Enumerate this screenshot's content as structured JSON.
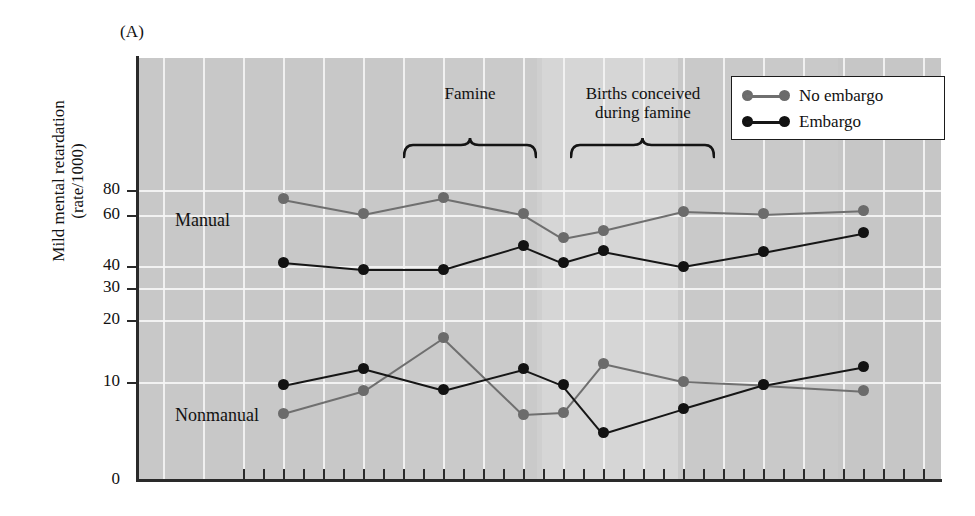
{
  "figure": {
    "panel_letter": "(A)",
    "y_axis_title_line1": "Mild mental retardation",
    "y_axis_title_line2": "(rate/1000)"
  },
  "legend": {
    "position": "top-right-inside",
    "items": [
      {
        "label": "No embargo",
        "color": "#6b6b6b"
      },
      {
        "label": "Embargo",
        "color": "#121212"
      }
    ]
  },
  "annotations": [
    {
      "name": "famine",
      "text": "Famine",
      "text2": ""
    },
    {
      "name": "births-conceived-during-famine",
      "text": "Births conceived",
      "text2": "during famine"
    }
  ],
  "group_labels": [
    {
      "name": "manual",
      "text": "Manual"
    },
    {
      "name": "nonmanual",
      "text": "Nonmanual"
    }
  ],
  "chart_data": {
    "type": "line",
    "title": "(A)",
    "xlabel": "",
    "ylabel": "Mild mental retardation (rate/1000)",
    "ylim": [
      0,
      90
    ],
    "y_ticks": [
      0,
      10,
      20,
      30,
      40,
      60,
      80
    ],
    "y_tick_labels": [
      "0",
      "10",
      "20",
      "30",
      "40",
      "60",
      "80"
    ],
    "y_axis_note": "broken / non-linear scale: spacing between 40-60 and 60-80 is compressed",
    "grid": true,
    "legend_entries": [
      "No embargo",
      "Embargo"
    ],
    "x_tick_count": 37,
    "x_tick_labels": [],
    "annotation_spans": [
      {
        "label": "Famine",
        "x_start_px": 403,
        "x_end_px": 537
      },
      {
        "label": "Births conceived during famine",
        "x_start_px": 570,
        "x_end_px": 715
      }
    ],
    "panels": [
      {
        "name": "Manual",
        "series": [
          {
            "name": "No embargo",
            "color": "#6b6b6b",
            "points": [
              {
                "x": 283,
                "y": 73
              },
              {
                "x": 363,
                "y": 61
              },
              {
                "x": 443,
                "y": 74
              },
              {
                "x": 523,
                "y": 61
              },
              {
                "x": 563,
                "y": 51
              },
              {
                "x": 603,
                "y": 54
              },
              {
                "x": 683,
                "y": 63
              },
              {
                "x": 763,
                "y": 61
              },
              {
                "x": 863,
                "y": 64
              }
            ]
          },
          {
            "name": "Embargo",
            "color": "#121212",
            "points": [
              {
                "x": 283,
                "y": 41.5
              },
              {
                "x": 363,
                "y": 38.5
              },
              {
                "x": 443,
                "y": 38.5
              },
              {
                "x": 523,
                "y": 48
              },
              {
                "x": 563,
                "y": 41.5
              },
              {
                "x": 603,
                "y": 46
              },
              {
                "x": 683,
                "y": 40
              },
              {
                "x": 763,
                "y": 45.5
              },
              {
                "x": 863,
                "y": 53
              }
            ]
          }
        ]
      },
      {
        "name": "Nonmanual",
        "series": [
          {
            "name": "No embargo",
            "color": "#6b6b6b",
            "points": [
              {
                "x": 283,
                "y": 6.8
              },
              {
                "x": 363,
                "y": 9.1
              },
              {
                "x": 443,
                "y": 17.2
              },
              {
                "x": 523,
                "y": 6.7
              },
              {
                "x": 563,
                "y": 6.9
              },
              {
                "x": 603,
                "y": 13
              },
              {
                "x": 683,
                "y": 10.1
              },
              {
                "x": 763,
                "y": 9.7
              },
              {
                "x": 863,
                "y": 9.1
              }
            ]
          },
          {
            "name": "Embargo",
            "color": "#121212",
            "points": [
              {
                "x": 283,
                "y": 9.7
              },
              {
                "x": 363,
                "y": 12.2
              },
              {
                "x": 443,
                "y": 9.2
              },
              {
                "x": 523,
                "y": 12.1
              },
              {
                "x": 563,
                "y": 9.7
              },
              {
                "x": 603,
                "y": 4.8
              },
              {
                "x": 683,
                "y": 7.3
              },
              {
                "x": 763,
                "y": 9.7
              },
              {
                "x": 863,
                "y": 12.5
              }
            ]
          }
        ]
      }
    ]
  }
}
